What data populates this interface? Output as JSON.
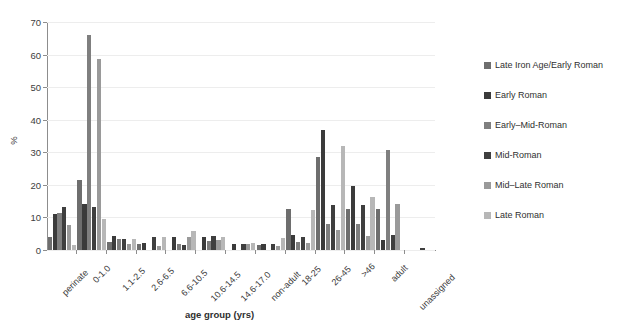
{
  "chart_data": {
    "type": "bar",
    "title": "",
    "xlabel": "age group (yrs)",
    "ylabel": "%",
    "ylim": [
      0,
      70
    ],
    "yticks": [
      0,
      10,
      20,
      30,
      40,
      50,
      60,
      70
    ],
    "grid": true,
    "legend_position": "right",
    "categories": [
      "perinate",
      "0-1.0",
      "1.1-2.5",
      "2.6-6.5",
      "6.6-10.5",
      "10.6-14.5",
      "14.6-17.0",
      "non-adult",
      "18-25",
      "26-45",
      ">46",
      "adult",
      "unassigned"
    ],
    "series": [
      {
        "name": "Late Iron Age/Early Roman",
        "color": "#6e6e6e",
        "values": [
          3.9,
          21.5,
          2.6,
          1.9,
          0.0,
          0.0,
          0.0,
          1.6,
          12.5,
          28.6,
          12.7,
          12.7,
          0.0
        ]
      },
      {
        "name": "Early Roman",
        "color": "#3b3b3b",
        "values": [
          11.1,
          14.0,
          4.2,
          2.1,
          4.0,
          4.1,
          1.7,
          1.8,
          4.6,
          36.7,
          19.8,
          3.0,
          0.0
        ]
      },
      {
        "name": "Early–Mid-Roman",
        "color": "#7f7f7f",
        "values": [
          11.3,
          66.0,
          3.4,
          0.0,
          1.7,
          2.9,
          0.0,
          0.0,
          2.4,
          7.9,
          8.1,
          30.8,
          0.0
        ]
      },
      {
        "name": "Mid-Roman",
        "color": "#3f3f3f",
        "values": [
          13.3,
          13.3,
          3.4,
          4.0,
          1.6,
          4.2,
          1.8,
          1.7,
          4.1,
          13.8,
          13.8,
          4.6,
          0.5
        ]
      },
      {
        "name": "Mid–Late Roman",
        "color": "#9a9a9a",
        "values": [
          7.6,
          58.6,
          1.7,
          1.1,
          3.9,
          3.1,
          2.0,
          1.1,
          2.3,
          6.1,
          4.4,
          14.2,
          0.0
        ]
      },
      {
        "name": "Late Roman",
        "color": "#b7b7b7",
        "values": [
          1.5,
          9.5,
          3.5,
          4.1,
          5.9,
          4.0,
          2.1,
          3.7,
          12.2,
          31.8,
          16.2,
          0.0,
          0.0
        ]
      }
    ]
  }
}
